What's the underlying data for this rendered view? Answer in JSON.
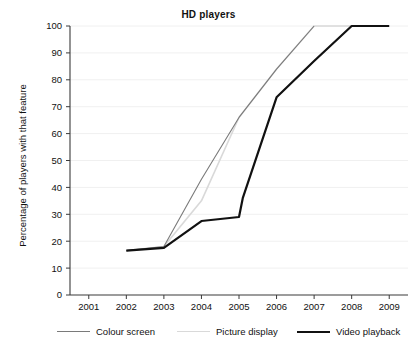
{
  "chart_data": {
    "type": "line",
    "title": "HD players",
    "xlabel": "",
    "ylabel": "Percentage of players with that feature",
    "x": [
      2001,
      2002,
      2003,
      2004,
      2005,
      2006,
      2007,
      2008,
      2009
    ],
    "xtick_labels": [
      "2001",
      "2002",
      "2003",
      "2004",
      "2005",
      "2006",
      "2007",
      "2008",
      "2009"
    ],
    "ytick_labels": [
      "0",
      "10",
      "20",
      "30",
      "40",
      "50",
      "60",
      "70",
      "80",
      "90",
      "100"
    ],
    "ylim": [
      0,
      100
    ],
    "xlim": [
      2000.5,
      2009.5
    ],
    "ytick_step": 10,
    "grid": "horizontal-faint",
    "legend_position": "below",
    "series": [
      {
        "name": "Colour screen",
        "color": "#7a7a7a",
        "width": 1.1,
        "points": [
          {
            "x": 2002,
            "y": 16.5
          },
          {
            "x": 2003,
            "y": 18
          },
          {
            "x": 2004,
            "y": 43
          },
          {
            "x": 2005,
            "y": 66
          },
          {
            "x": 2006,
            "y": 84
          },
          {
            "x": 2007,
            "y": 100
          }
        ]
      },
      {
        "name": "Picture display",
        "color": "#d9d9d9",
        "width": 1.6,
        "points": [
          {
            "x": 2002,
            "y": 16.5
          },
          {
            "x": 2003,
            "y": 18
          },
          {
            "x": 2004,
            "y": 35
          },
          {
            "x": 2005,
            "y": 66
          },
          {
            "x": 2006,
            "y": 84
          },
          {
            "x": 2007,
            "y": 100
          },
          {
            "x": 2008,
            "y": 100
          }
        ]
      },
      {
        "name": "Video playback",
        "color": "#111111",
        "width": 2.2,
        "points": [
          {
            "x": 2002,
            "y": 16.5
          },
          {
            "x": 2003,
            "y": 17.5
          },
          {
            "x": 2004,
            "y": 27.5
          },
          {
            "x": 2005,
            "y": 29
          },
          {
            "x": 2005.1,
            "y": 36
          },
          {
            "x": 2006,
            "y": 73.5
          },
          {
            "x": 2007,
            "y": 87
          },
          {
            "x": 2008,
            "y": 100
          },
          {
            "x": 2009,
            "y": 100
          }
        ]
      }
    ]
  },
  "legend": {
    "items": [
      {
        "label": "Colour screen"
      },
      {
        "label": "Picture display"
      },
      {
        "label": "Video playback"
      }
    ]
  }
}
